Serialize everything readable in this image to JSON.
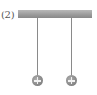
{
  "figure": {
    "label": "(2)",
    "ceiling": {
      "color": "#9a9a9a"
    },
    "strings": [
      {
        "x": 37
      },
      {
        "x": 71
      }
    ],
    "balls": [
      {
        "charge": "+",
        "icon": "positive-charge-icon",
        "color": "#8c8c8c"
      },
      {
        "charge": "+",
        "icon": "positive-charge-icon",
        "color": "#8c8c8c"
      }
    ]
  }
}
